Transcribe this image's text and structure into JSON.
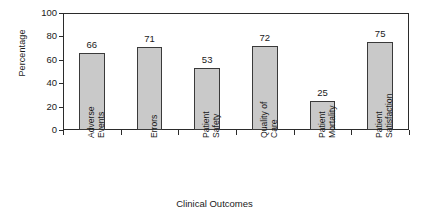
{
  "chart_data": {
    "type": "bar",
    "title": "",
    "subtitle": "",
    "xlabel": "Clinical Outcomes",
    "ylabel": "Percentage",
    "categories": [
      "Adverse Events",
      "Errors",
      "Patient Safety",
      "Quality of Care",
      "Patient Mortality",
      "Patient Satisfaction"
    ],
    "category_lines": [
      [
        "Adverse",
        "Events"
      ],
      [
        "Errors"
      ],
      [
        "Patient",
        "Safety"
      ],
      [
        "Quality of",
        "Care"
      ],
      [
        "Patient",
        "Mortality"
      ],
      [
        "Patient",
        "Satisfaction"
      ]
    ],
    "values": [
      66,
      71,
      53,
      72,
      25,
      75
    ],
    "value_labels": [
      "66",
      "71",
      "53",
      "72",
      "25",
      "75"
    ],
    "ylim": [
      0,
      100
    ],
    "ytick_values": [
      0,
      20,
      40,
      60,
      80,
      100
    ],
    "ytick_labels": [
      "0",
      "20",
      "40",
      "60",
      "80",
      "100"
    ],
    "grid": false,
    "legend": false,
    "legend_position": "none",
    "bar_fill_color": "#c9c9c9",
    "bar_border_color": "#3a3a3a",
    "axis_color": "#2b2b2b",
    "text_color": "#1a1a1a",
    "background_color": "#ffffff"
  }
}
